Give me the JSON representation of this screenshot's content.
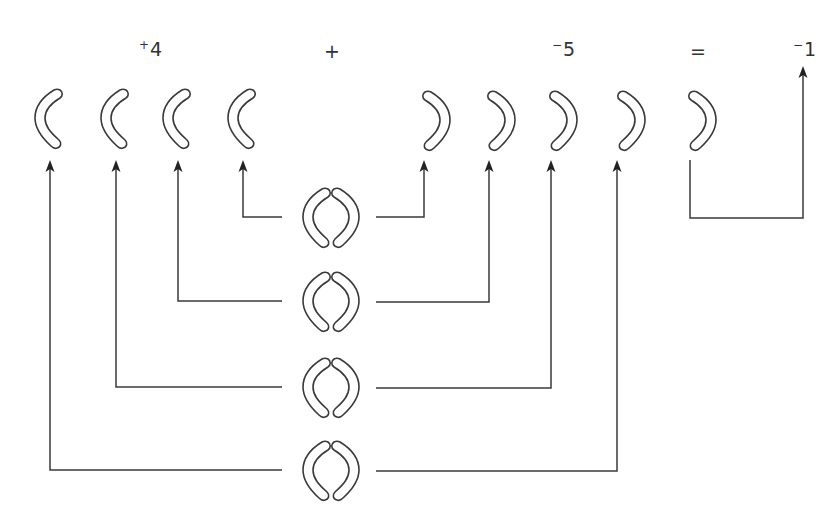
{
  "diagram": {
    "equation": {
      "term1": {
        "sign": "+",
        "value": "4"
      },
      "operator": "+",
      "term2": {
        "sign": "−",
        "value": "5"
      },
      "equals": "=",
      "result": {
        "sign": "−",
        "value": "1"
      }
    },
    "colors": {
      "stroke": "#3a3a3a",
      "arrow": "#222222",
      "background": "#ffffff",
      "text": "#333333"
    },
    "positive_counters": {
      "symbol": "(",
      "count": 4,
      "x": [
        48,
        114,
        176,
        241
      ]
    },
    "negative_counters": {
      "symbol": ")",
      "count": 5,
      "x": [
        437,
        502,
        564,
        632,
        703
      ]
    },
    "zero_pairs": {
      "count": 4,
      "x": 330,
      "y": [
        217,
        301,
        387,
        470
      ]
    },
    "leftover": {
      "counter": ")",
      "result_label": "−1"
    }
  }
}
